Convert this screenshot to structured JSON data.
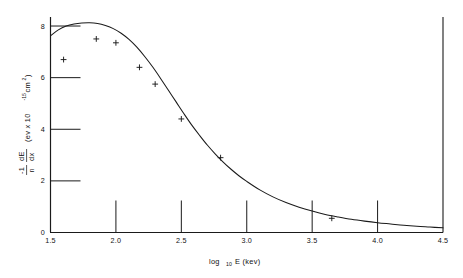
{
  "figure": {
    "background_color": "#ffffff",
    "ink_color": "#1a1a1a"
  },
  "chart_data": {
    "type": "scatter",
    "title": "",
    "subtitle": "",
    "xlabel_parts": {
      "base": "log",
      "subscript": "10",
      "rest": "E (kev)"
    },
    "xlabel": "log10 E (kev)",
    "ylabel_parts": {
      "numerator_sign": "-1",
      "denominator": "n",
      "derivative_numerator": "dE",
      "derivative_denominator": "dx",
      "units_open": "(ev x 10",
      "units_exponent": "-15",
      "units_close": " cm",
      "units_close_exponent": "2",
      "units_tail": ")"
    },
    "ylabel": "-1/n dE/dx (ev x 10^-15 cm^2)",
    "xlim": [
      1.5,
      4.5
    ],
    "ylim": [
      0,
      8.35
    ],
    "xticks": [
      1.5,
      2.0,
      2.5,
      3.0,
      3.5,
      4.0,
      4.5
    ],
    "xticklabels": [
      "1.5",
      "2.0",
      "2.5",
      "3.0",
      "3.5",
      "4.0",
      "4.5"
    ],
    "yticks": [
      0,
      2,
      4,
      6,
      8
    ],
    "yticklabels": [
      "0",
      "2",
      "4",
      "6",
      "8"
    ],
    "grid": false,
    "legend": "none",
    "marker_style": "plus",
    "points": [
      {
        "x": 1.6,
        "y": 6.7
      },
      {
        "x": 1.85,
        "y": 7.5
      },
      {
        "x": 2.0,
        "y": 7.35
      },
      {
        "x": 2.18,
        "y": 6.4
      },
      {
        "x": 2.3,
        "y": 5.75
      },
      {
        "x": 2.5,
        "y": 4.4
      },
      {
        "x": 2.8,
        "y": 2.9
      },
      {
        "x": 3.65,
        "y": 0.55
      }
    ],
    "series": [
      {
        "name": "fitted curve",
        "x": [
          1.5,
          1.56,
          1.62,
          1.68,
          1.74,
          1.8,
          1.86,
          1.92,
          1.98,
          2.04,
          2.1,
          2.16,
          2.22,
          2.28,
          2.34,
          2.4,
          2.46,
          2.52,
          2.58,
          2.64,
          2.7,
          2.76,
          2.82,
          2.88,
          2.94,
          3.0,
          3.1,
          3.2,
          3.3,
          3.4,
          3.5,
          3.6,
          3.7,
          3.8,
          3.9,
          4.0,
          4.1,
          4.2,
          4.3,
          4.4,
          4.5
        ],
        "values": [
          7.62,
          7.85,
          8.0,
          8.08,
          8.12,
          8.13,
          8.1,
          8.02,
          7.9,
          7.72,
          7.48,
          7.18,
          6.82,
          6.42,
          5.98,
          5.52,
          5.06,
          4.6,
          4.16,
          3.76,
          3.38,
          3.04,
          2.73,
          2.45,
          2.2,
          1.98,
          1.65,
          1.38,
          1.16,
          0.98,
          0.83,
          0.7,
          0.6,
          0.51,
          0.44,
          0.38,
          0.33,
          0.28,
          0.24,
          0.21,
          0.18
        ]
      }
    ]
  }
}
